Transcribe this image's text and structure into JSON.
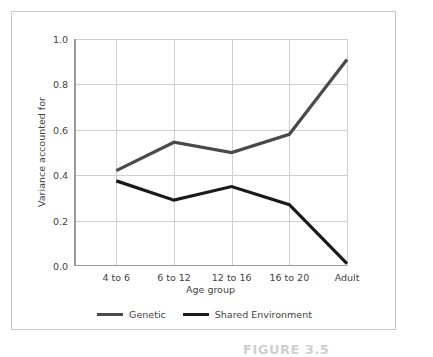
{
  "figure": {
    "background_color": "#ffffff",
    "panel_border_color": "#c9c9c9",
    "caption_partial": "FIGURE 3.5"
  },
  "chart_data": {
    "type": "line",
    "title": "",
    "xlabel": "Age group",
    "ylabel": "Variance accounted for",
    "categories": [
      "4 to 6",
      "6 to 12",
      "12 to 16",
      "16 to 20",
      "Adult"
    ],
    "ylim": [
      0.0,
      1.0
    ],
    "yticks": [
      "0.0",
      "0.2",
      "0.4",
      "0.6",
      "0.8",
      "1.0"
    ],
    "ytick_values": [
      0.0,
      0.2,
      0.4,
      0.6,
      0.8,
      1.0
    ],
    "grid": "both",
    "legend_position": "bottom-center",
    "series": [
      {
        "name": "Genetic",
        "color": "#4a4a4a",
        "values": [
          0.42,
          0.545,
          0.5,
          0.58,
          0.91
        ]
      },
      {
        "name": "Shared Environment",
        "color": "#1a1a1a",
        "values": [
          0.375,
          0.29,
          0.35,
          0.27,
          0.01
        ]
      }
    ]
  }
}
